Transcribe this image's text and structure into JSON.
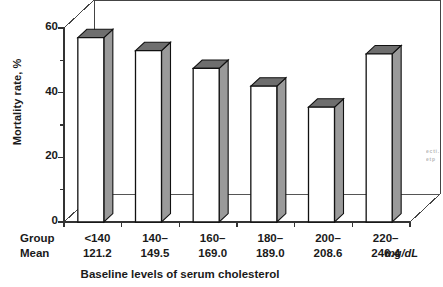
{
  "chart_data": {
    "type": "bar",
    "title": "",
    "subtitle": "",
    "xlabel": "Baseline levels of serum cholesterol",
    "ylabel": "Mortality rate, %",
    "unit_label": "mg/dL",
    "row_header_group": "Group",
    "row_header_mean": "Mean",
    "categories": [
      "<140",
      "140–",
      "160–",
      "180–",
      "200–",
      "220–"
    ],
    "group_means": [
      "121.2",
      "149.5",
      "169.0",
      "189.0",
      "208.6",
      "246.4"
    ],
    "values": [
      57,
      53,
      47.5,
      42,
      35.5,
      52
    ],
    "ylim": [
      0,
      60
    ],
    "yticks": [
      0,
      20,
      40,
      60
    ],
    "ytick_labels": [
      "0",
      "20",
      "40",
      "60"
    ],
    "yminor": [
      10,
      30,
      50
    ],
    "grid": false,
    "legend": "none",
    "style": "3d-perspective-bars",
    "bar_face_color": "#ffffff",
    "bar_side_color": "#9a9a9a",
    "bar_top_color": "#6e6e6e",
    "outline_color": "#111111",
    "axis_color": "#333333"
  },
  "edge_caption_fragment": "e c t i . e t p",
  "colors": {
    "background": "#ffffff",
    "text": "#1a1a1a",
    "axis": "#333333",
    "bar_face": "#ffffff",
    "bar_side": "#9a9a9a",
    "bar_top": "#6e6e6e"
  }
}
